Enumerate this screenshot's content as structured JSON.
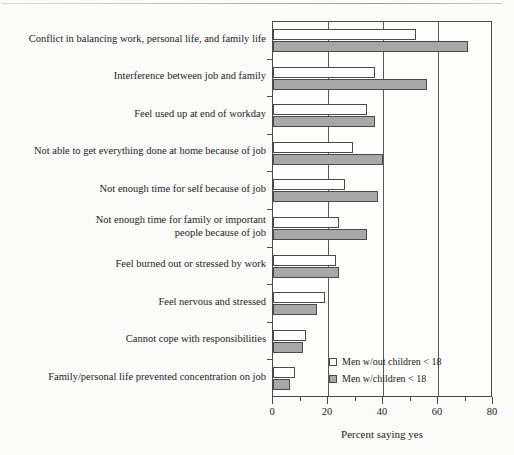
{
  "chart_data": {
    "type": "bar",
    "orientation": "horizontal",
    "title": "",
    "xlabel": "Percent saying yes",
    "ylabel": "",
    "xlim": [
      0,
      80
    ],
    "xticks": [
      0,
      20,
      40,
      60,
      80
    ],
    "xtick_labels": [
      "0",
      "20",
      "40",
      "60",
      "80"
    ],
    "minor_xticks": [
      10,
      30,
      50,
      70
    ],
    "grid": "vertical-major",
    "legend_position": "inside-lower-right",
    "categories": [
      "Conflict in balancing work, personal life, and family life",
      "Interference between job and family",
      "Feel used up at end of workday",
      "Not able to get everything done at home because of job",
      "Not enough time for self because of job",
      "Not enough time for family or important\npeople because of job",
      "Feel burned out or stressed by work",
      "Feel nervous and stressed",
      "Cannot cope with responsibilities",
      "Family/personal life prevented concentration on job"
    ],
    "series": [
      {
        "name": "Men w/out children < 18",
        "color": "#ffffff",
        "values": [
          52,
          37,
          34,
          29,
          26,
          24,
          23,
          19,
          12,
          8
        ]
      },
      {
        "name": "Men w/children < 18",
        "color": "#a8a8a8",
        "values": [
          71,
          56,
          37,
          40,
          38,
          34,
          24,
          16,
          11,
          6
        ]
      }
    ]
  },
  "legend": {
    "items": [
      {
        "label": "Men w/out children < 18",
        "swatch": "light"
      },
      {
        "label": "Men w/children < 18",
        "swatch": "dark"
      }
    ]
  },
  "axis": {
    "x_title": "Percent saying yes"
  },
  "colors": {
    "bar_light": "#ffffff",
    "bar_dark": "#a8a8a8",
    "frame": "#4a4a4a",
    "text": "#1b1b1b",
    "background": "#fbfbfa"
  }
}
